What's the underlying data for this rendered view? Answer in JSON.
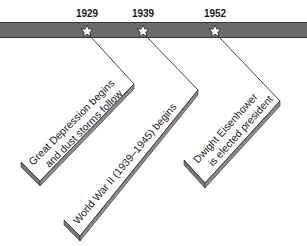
{
  "timeline": {
    "band_color": "#6e6e6e",
    "events": [
      {
        "year": "1929",
        "line1": "Great Depression begins",
        "line2": "and dust storms follow"
      },
      {
        "year": "1939",
        "line1": "World War II (1939–1945) begins",
        "line2": ""
      },
      {
        "year": "1952",
        "line1": "Dwight Eisenhower",
        "line2": "is elected president"
      }
    ]
  }
}
